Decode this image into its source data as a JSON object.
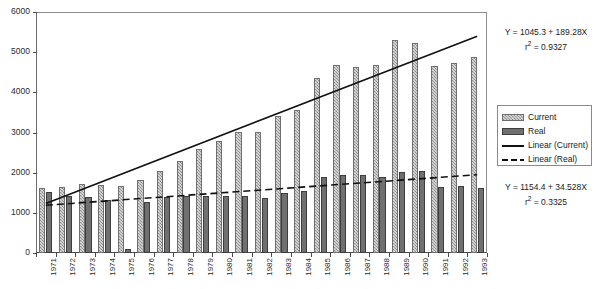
{
  "chart_data": {
    "type": "bar",
    "title": "",
    "xlabel": "",
    "ylabel": "",
    "ylim": [
      0,
      6000
    ],
    "ytick_step": 1000,
    "yticks": [
      0,
      1000,
      2000,
      3000,
      4000,
      5000,
      6000
    ],
    "grid": false,
    "legend_position": "right",
    "categories": [
      "1971",
      "1972",
      "1973",
      "1974",
      "1975",
      "1976",
      "1977",
      "1978",
      "1979",
      "1980",
      "1981",
      "1982",
      "1983",
      "1984",
      "1985",
      "1986",
      "1987",
      "1988",
      "1989",
      "1990",
      "1991",
      "1992",
      "1993"
    ],
    "series": [
      {
        "name": "Current",
        "style": "bar-hatched-light",
        "color": "#a8a8a8",
        "values": [
          1610,
          1650,
          1720,
          1700,
          1680,
          1830,
          2050,
          2300,
          2600,
          2800,
          3020,
          3010,
          3420,
          3550,
          4350,
          4680,
          4620,
          4680,
          5300,
          5230,
          4650,
          4740,
          4870
        ]
      },
      {
        "name": "Real",
        "style": "bar-solid-dark",
        "color": "#707070",
        "values": [
          1510,
          1420,
          1390,
          1310,
          100,
          1280,
          1400,
          1410,
          1410,
          1420,
          1430,
          1370,
          1490,
          1550,
          1880,
          1930,
          1950,
          1900,
          2020,
          2050,
          1640,
          1660,
          1620
        ]
      }
    ],
    "trendlines": [
      {
        "name": "Linear (Current)",
        "style": "solid",
        "color": "#111111",
        "intercept": 1045.3,
        "slope": 189.28,
        "r2": 0.9327
      },
      {
        "name": "Linear (Real)",
        "style": "dashed",
        "color": "#111111",
        "intercept": 1154.4,
        "slope": 34.528,
        "r2": 0.3325
      }
    ],
    "annotations": [
      {
        "id": "current-fit",
        "equation": "Y = 1045.3 + 189.28X",
        "r2_text": "r2 = 0.9327"
      },
      {
        "id": "real-fit",
        "equation": "Y = 1154.4 + 34.528X",
        "r2_text": "r2 = 0.3325"
      }
    ]
  },
  "axes": {
    "y": {
      "labels": [
        "6000",
        "5000",
        "4000",
        "3000",
        "2000",
        "1000",
        "0"
      ]
    },
    "x": {
      "labels": [
        "1971",
        "1972",
        "1973",
        "1974",
        "1975",
        "1976",
        "1977",
        "1978",
        "1979",
        "1980",
        "1981",
        "1982",
        "1983",
        "1984",
        "1985",
        "1986",
        "1987",
        "1988",
        "1989",
        "1990",
        "1991",
        "1992",
        "1993"
      ]
    }
  },
  "legend": {
    "items": [
      {
        "label": "Current",
        "swatch": "sw-current"
      },
      {
        "label": "Real",
        "swatch": "sw-real"
      },
      {
        "label": "Linear (Current)",
        "swatch": "sw-line-solid"
      },
      {
        "label": "Linear (Real)",
        "swatch": "sw-line-dashed"
      }
    ]
  },
  "annotation_current": {
    "equation": "Y = 1045.3 + 189.28X",
    "r_prefix": "r",
    "r_sup": "2",
    "r_value": " = 0.9327"
  },
  "annotation_real": {
    "equation": "Y = 1154.4 + 34.528X",
    "r_prefix": "r",
    "r_sup": "2",
    "r_value": " = 0.3325"
  },
  "colors": {
    "current": "#a8a8a8",
    "real": "#707070",
    "trend": "#111111",
    "axis": "#4a4a4a"
  }
}
